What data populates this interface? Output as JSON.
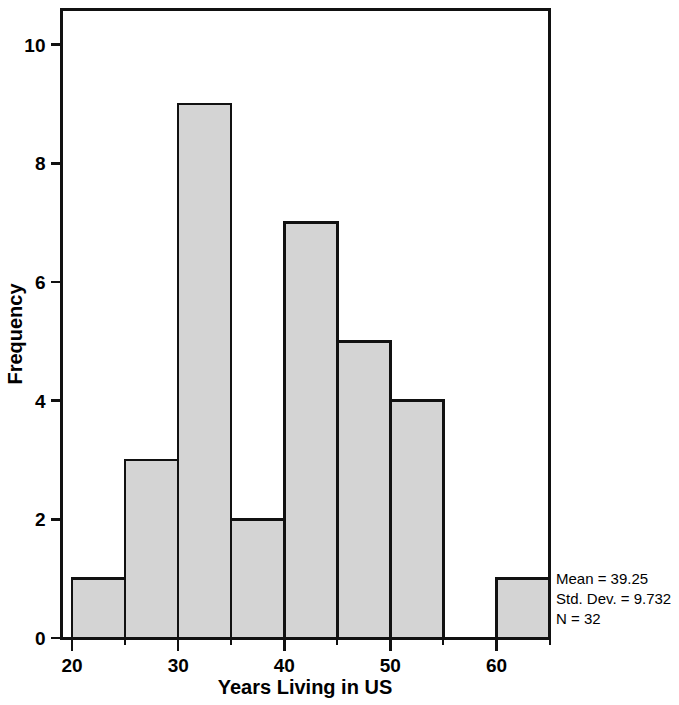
{
  "chart_data": {
    "type": "bar",
    "title": "",
    "subtitle": "",
    "xlabel": "Years Living in US",
    "ylabel": "Frequency",
    "xlim": [
      19,
      65
    ],
    "ylim": [
      0,
      10.6
    ],
    "grid": false,
    "legend_position": "none",
    "bin_width": 5,
    "bin_edges": [
      20,
      25,
      30,
      35,
      40,
      45,
      50,
      55,
      60,
      65
    ],
    "categories": [
      "20-25",
      "25-30",
      "30-35",
      "35-40",
      "40-45",
      "45-50",
      "50-55",
      "55-60",
      "60-65"
    ],
    "values": [
      1,
      3,
      9,
      2,
      7,
      5,
      4,
      0,
      1
    ],
    "bin_centers": [
      22.5,
      27.5,
      32.5,
      37.5,
      42.5,
      47.5,
      52.5,
      57.5,
      62.5
    ],
    "xticks": [
      20,
      30,
      40,
      50,
      60
    ],
    "xtick_labels": [
      "20",
      "30",
      "40",
      "50",
      "60"
    ],
    "xticks_minor": [
      25,
      35,
      45,
      55,
      65
    ],
    "yticks": [
      0,
      2,
      4,
      6,
      8,
      10
    ],
    "ytick_labels": [
      "0",
      "2",
      "4",
      "6",
      "8",
      "10"
    ],
    "bar_fill_color": "#d4d4d4",
    "bar_edge_color": "#111111",
    "frame_color": "#111111",
    "background_color": "#ffffff",
    "annotations": [
      "Mean = 39.25",
      "Std. Dev. = 9.732",
      "N = 32"
    ],
    "statistics": {
      "mean": 39.25,
      "std_dev": 9.732,
      "n": 32
    }
  }
}
